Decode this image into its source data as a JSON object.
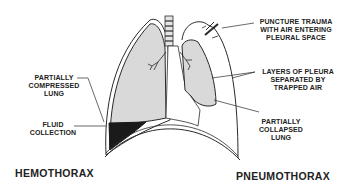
{
  "diagram": {
    "left_title": "HEMOTHORAX",
    "right_title": "PNEUMOTHORAX",
    "labels": {
      "partially_compressed_lung": [
        "PARTIALLY",
        "COMPRESSED",
        "LUNG"
      ],
      "fluid_collection": [
        "FLUID",
        "COLLECTION"
      ],
      "puncture_trauma": [
        "PUNCTURE TRAUMA",
        "WITH AIR ENTERING",
        "PLEURAL SPACE"
      ],
      "layers_of_pleura": [
        "LAYERS OF PLEURA",
        "SEPARATED BY",
        "TRAPPED AIR"
      ],
      "partially_collapsed_lung": [
        "PARTIALLY",
        "COLLAPSED",
        "LUNG"
      ]
    },
    "colors": {
      "lung_fill": "#d9d9d9",
      "fluid_fill": "#1a1a1a",
      "outline": "#2a2a2a"
    }
  }
}
